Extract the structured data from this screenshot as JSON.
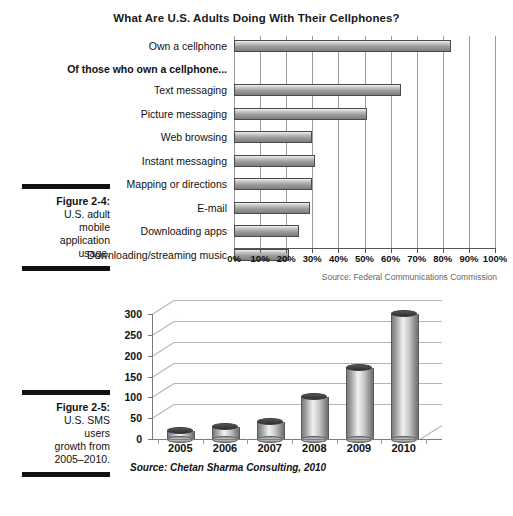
{
  "figure_2_4": {
    "number": "Figure 2-4:",
    "lines": [
      "U.S. adult",
      "mobile",
      "application",
      "usage."
    ]
  },
  "figure_2_5": {
    "number": "Figure 2-5:",
    "lines": [
      "U.S. SMS",
      "users",
      "growth from",
      "2005–2010."
    ]
  },
  "chart_data": [
    {
      "type": "bar",
      "orientation": "horizontal",
      "title": "What Are U.S. Adults Doing With Their Cellphones?",
      "xlabel": "",
      "ylabel": "",
      "xlim": [
        0,
        100
      ],
      "grid": true,
      "tick_labels": [
        "0%",
        "10%",
        "20%",
        "30%",
        "40%",
        "50%",
        "60%",
        "70%",
        "80%",
        "90%",
        "100%"
      ],
      "tick_values": [
        0,
        10,
        20,
        30,
        40,
        50,
        60,
        70,
        80,
        90,
        100
      ],
      "section_label": "Of those who own a cellphone...",
      "categories": [
        "Own a cellphone",
        "Text messaging",
        "Picture messaging",
        "Web browsing",
        "Instant messaging",
        "Mapping or directions",
        "E-mail",
        "Downloading apps",
        "Downloading/streaming music"
      ],
      "values": [
        83,
        64,
        51,
        30,
        31,
        30,
        29,
        25,
        21
      ],
      "source": "Source: Federal Communications Commission"
    },
    {
      "type": "bar",
      "orientation": "vertical",
      "title": "",
      "xlabel": "",
      "ylabel": "SMS subscribers Millions",
      "ylim": [
        0,
        300
      ],
      "grid": true,
      "categories": [
        "2005",
        "2006",
        "2007",
        "2008",
        "2009",
        "2010"
      ],
      "values": [
        20,
        28,
        42,
        100,
        170,
        300
      ],
      "tick_labels": [
        "0",
        "50",
        "100",
        "150",
        "200",
        "250",
        "300"
      ],
      "tick_values": [
        0,
        50,
        100,
        150,
        200,
        250,
        300
      ],
      "source": "Source: Chetan Sharma Consulting, 2010"
    }
  ]
}
